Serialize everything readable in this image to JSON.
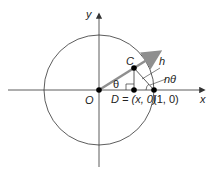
{
  "diagram": {
    "axis_labels": {
      "x": "x",
      "y": "y"
    },
    "points": {
      "origin": "O",
      "c": "C",
      "d": "D = (x, 0)",
      "unit": "(1, 0)"
    },
    "angle_labels": {
      "theta": "θ",
      "ntheta": "nθ"
    },
    "segment_labels": {
      "h": "h"
    },
    "colors": {
      "ray": "#8f8f8f",
      "lines": "#222222",
      "points": "#000000"
    }
  }
}
